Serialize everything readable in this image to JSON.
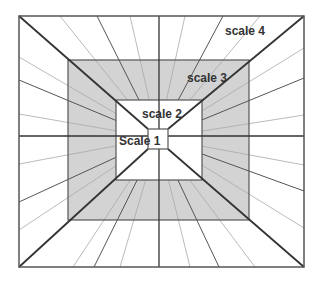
{
  "diagram": {
    "type": "nested-scales-perspective",
    "colors": {
      "background": "#ffffff",
      "band_fill": "#d3d3d3",
      "inner_fill": "#ffffff",
      "border": "#444444",
      "thin_spoke": "#aaaaaa",
      "thick_spoke": "#444444",
      "text": "#333333"
    },
    "labels": {
      "scale1": "Scale 1",
      "scale2": "scale 2",
      "scale3": "scale 3",
      "scale4": "scale 4"
    },
    "rects": {
      "scale4": [
        19,
        16,
        304,
        267
      ],
      "scale3": [
        68,
        60,
        249,
        220
      ],
      "scale2": [
        116,
        100,
        202,
        180
      ],
      "scale1": [
        148,
        129,
        168,
        149
      ]
    },
    "center": [
      158,
      138
    ]
  }
}
